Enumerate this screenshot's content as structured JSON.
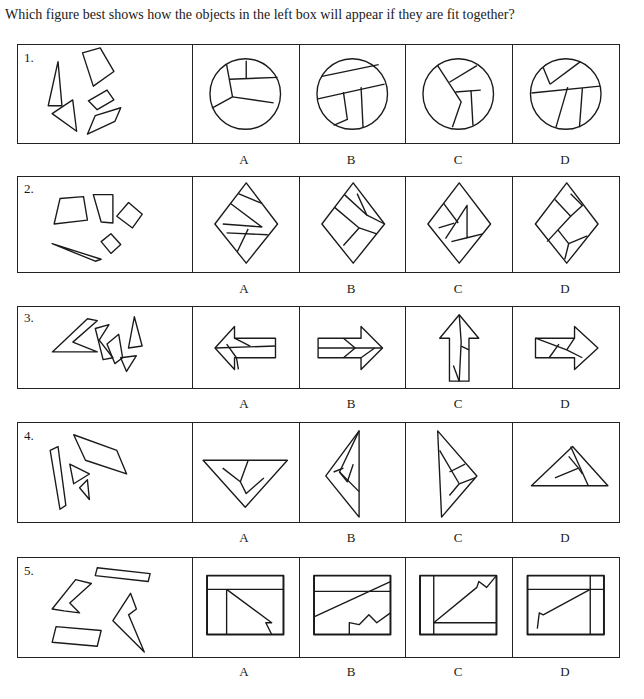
{
  "question": "Which figure best shows how the objects in the left box will appear if they are fit together?",
  "options": [
    "A",
    "B",
    "C",
    "D"
  ],
  "items": [
    {
      "number": "1.",
      "shape": "circle"
    },
    {
      "number": "2.",
      "shape": "diamond"
    },
    {
      "number": "3.",
      "shape": "arrow"
    },
    {
      "number": "4.",
      "shape": "triangle"
    },
    {
      "number": "5.",
      "shape": "rectangle"
    }
  ]
}
